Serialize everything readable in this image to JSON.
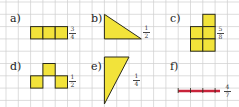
{
  "colors": {
    "grid": "#c9c9c9",
    "fill": "#f2e33a",
    "stroke": "#2a2a1a",
    "segment": "#c8233a"
  },
  "items": [
    {
      "label": "a)",
      "fraction": {
        "num": "3",
        "den": "4"
      },
      "shape": "three squares in a row"
    },
    {
      "label": "b)",
      "fraction": {
        "num": "1",
        "den": "2"
      },
      "shape": "right triangle"
    },
    {
      "label": "c)",
      "fraction": {
        "num": "5",
        "den": "8"
      },
      "shape": "L-shaped polyomino of 5 squares? (3 cells shown)"
    },
    {
      "label": "d)",
      "fraction": {
        "num": "1",
        "den": "2"
      },
      "shape": "three squares in pyramid"
    },
    {
      "label": "e)",
      "fraction": {
        "num": "1",
        "den": "4"
      },
      "shape": "tall right triangle"
    },
    {
      "label": "f)",
      "fraction": {
        "num": "4",
        "den": "7"
      },
      "shape": "line segment with 4 divisions"
    }
  ]
}
